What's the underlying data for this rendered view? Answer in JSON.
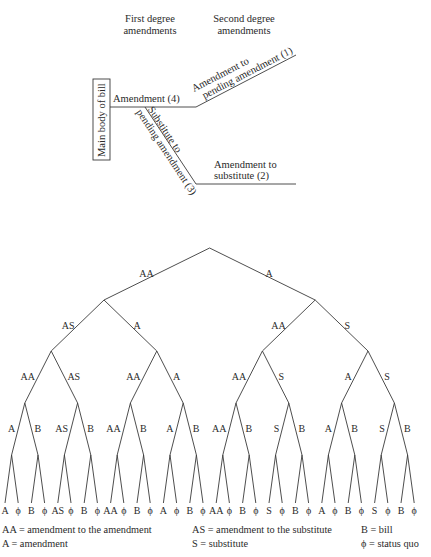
{
  "procedure_diagram": {
    "headers": {
      "first_line1": "First degree",
      "first_line2": "amendments",
      "second_line1": "Second degree",
      "second_line2": "amendments"
    },
    "main_body": "Main body of bill",
    "amendment_4": "Amendment (4)",
    "amend_pending_line1": "Amendment to",
    "amend_pending_line2": "pending amendment (1)",
    "substitute_line1": "Substitute to",
    "substitute_line2": "pending amendment (3)",
    "amend_substitute_line1": "Amendment to",
    "amend_substitute_line2": "substitute (2)"
  },
  "tree": {
    "level1": {
      "left": "AA",
      "right": "A"
    },
    "level2": [
      "AS",
      "A",
      "AA",
      "S"
    ],
    "level3": [
      "AA",
      "AS",
      "AA",
      "A",
      "AA",
      "S",
      "A",
      "S"
    ],
    "level4": [
      "A",
      "B",
      "AS",
      "B",
      "AA",
      "B",
      "A",
      "B",
      "AA",
      "B",
      "S",
      "B",
      "A",
      "B",
      "S",
      "B"
    ],
    "leaves": [
      "A",
      "ϕ",
      "B",
      "ϕ",
      "AS",
      "ϕ",
      "B",
      "ϕ",
      "AA",
      "ϕ",
      "B",
      "ϕ",
      "A",
      "ϕ",
      "B",
      "ϕ",
      "AA",
      "ϕ",
      "B",
      "ϕ",
      "S",
      "ϕ",
      "B",
      "ϕ",
      "A",
      "ϕ",
      "B",
      "ϕ",
      "S",
      "ϕ",
      "B",
      "ϕ"
    ]
  },
  "legend": {
    "aa": "AA = amendment to the amendment",
    "a": "A = amendment",
    "as": "AS = amendment to the substitute",
    "s": "S = substitute",
    "b": "B = bill",
    "phi": "ϕ = status quo"
  }
}
